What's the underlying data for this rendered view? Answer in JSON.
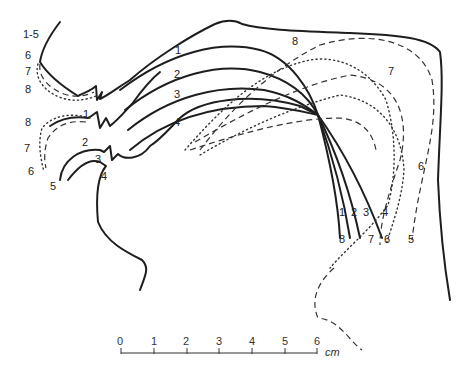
{
  "figure": {
    "type": "vocal-tract-tongue-profiles",
    "left_labels_upper": [
      "1-5",
      "6",
      "7",
      "8"
    ],
    "left_labels_lower": [
      "8",
      "7",
      "6",
      "5"
    ],
    "lip_labels": [
      "1",
      "2",
      "3",
      "4"
    ],
    "tongue_curve_labels": [
      "1",
      "2",
      "3",
      "4"
    ],
    "top_labels": [
      "8",
      "7"
    ],
    "right_side_label": "6",
    "bottom_labels_row1": [
      "1",
      "2",
      "3",
      "4",
      "6",
      "5"
    ],
    "bottom_labels_row2": [
      "8",
      "7",
      "6",
      "5"
    ],
    "line_styles": {
      "solid": [
        "1",
        "2",
        "3",
        "4"
      ],
      "dashed": [
        "5",
        "7"
      ],
      "dotted": [
        "6",
        "8"
      ]
    }
  },
  "scale": {
    "ticks": [
      "0",
      "1",
      "2",
      "3",
      "4",
      "5",
      "6"
    ],
    "unit": "cm"
  }
}
